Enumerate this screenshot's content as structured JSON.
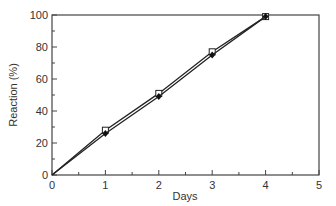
{
  "chart_data": {
    "type": "line",
    "title": "",
    "xlabel": "Days",
    "ylabel": "Reaction (%)",
    "xlim": [
      0,
      5
    ],
    "ylim": [
      0,
      100
    ],
    "xticks": [
      0,
      1,
      2,
      3,
      4,
      5
    ],
    "yticks": [
      0,
      20,
      40,
      60,
      80,
      100
    ],
    "grid": false,
    "legend": null,
    "x": [
      0,
      1,
      2,
      3,
      4
    ],
    "series": [
      {
        "name": "open-square",
        "marker": "open-square",
        "values": [
          0,
          28,
          51,
          77,
          99
        ]
      },
      {
        "name": "filled-diamond",
        "marker": "filled-diamond",
        "values": [
          0,
          26,
          49,
          75,
          99
        ]
      }
    ]
  }
}
